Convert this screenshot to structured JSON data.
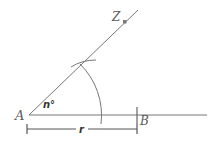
{
  "diagram": {
    "type": "geometric-construction",
    "labels": {
      "vertex": "A",
      "point_b": "B",
      "point_z": "Z",
      "angle": "n°",
      "radius": "r"
    },
    "colors": {
      "line": "#6e6e6e",
      "label": "#5a5a5a",
      "point": "#7a7a7a"
    }
  }
}
